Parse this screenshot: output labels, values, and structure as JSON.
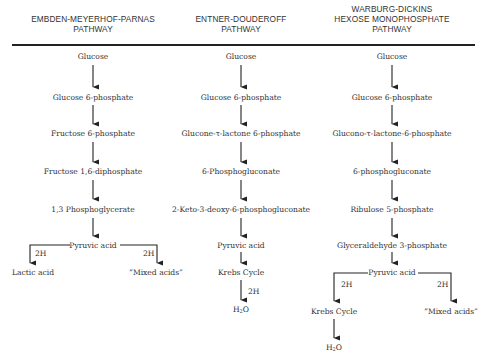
{
  "pathways": [
    {
      "id": "emp",
      "title_lines": [
        "EMBDEN-MEYERHOF-PARNAS",
        "PATHWAY"
      ],
      "steps": [
        "Glucose",
        "Glucose 6-phosphate",
        "Fructose 6-phosphate",
        "Fructose 1,6-diphosphate",
        "1,3 Phosphoglycerate",
        "Pyruvic acid"
      ],
      "branches": [
        {
          "cofactor": "2H",
          "product": "Lactic acid"
        },
        {
          "cofactor": "2H",
          "product": "“Mixed acids”"
        }
      ]
    },
    {
      "id": "ed",
      "title_lines": [
        "ENTNER-DOUDEROFF",
        "PATHWAY"
      ],
      "steps": [
        "Glucose",
        "Glucose 6-phosphate",
        "Glucone-τ-lactone 6-phosphate",
        "6-Phosphogluconate",
        "2-Keto-3-deoxy-6-phosphogluconate",
        "Pyruvic acid",
        "Krebs Cycle"
      ],
      "final_cofactor": "2H",
      "final_product": "H2O"
    },
    {
      "id": "wd",
      "title_lines": [
        "WARBURG-DICKINS",
        "HEXOSE MONOPHOSPHATE",
        "PATHWAY"
      ],
      "steps": [
        "Glucose",
        "Glucose 6-phosphate",
        "Glucono-τ-lactone-6-phosphate",
        "6-phosphogluconate",
        "Ribulose 5-phosphate",
        "Glyceraldehyde 3-phosphate",
        "Pyruvic acid"
      ],
      "branches": [
        {
          "cofactor": "2H",
          "product": "Krebs Cycle",
          "then": "H2O"
        },
        {
          "cofactor": "2H",
          "product": "“Mixed acids”"
        }
      ]
    }
  ]
}
